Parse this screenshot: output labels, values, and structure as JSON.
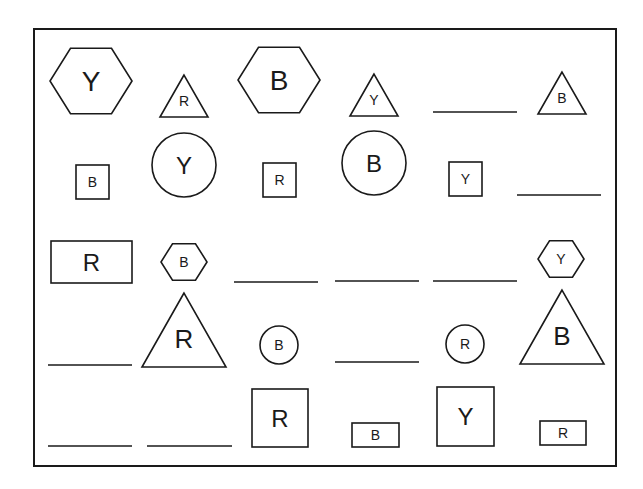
{
  "frame": {
    "x": 34,
    "y": 29,
    "w": 582,
    "h": 437
  },
  "shapes": [
    {
      "id": "r1c1",
      "type": "hexagon",
      "letter": "Y",
      "cx": 91,
      "cy": 81,
      "r": 41,
      "font": 28
    },
    {
      "id": "r1c2",
      "type": "triangle",
      "letter": "R",
      "cx": 184,
      "cy": 96,
      "w": 48,
      "h": 42,
      "font": 14
    },
    {
      "id": "r1c3",
      "type": "hexagon",
      "letter": "B",
      "cx": 279,
      "cy": 80,
      "r": 41,
      "font": 28
    },
    {
      "id": "r1c4",
      "type": "triangle",
      "letter": "Y",
      "cx": 374,
      "cy": 95,
      "w": 48,
      "h": 42,
      "font": 14
    },
    {
      "id": "r1c5",
      "type": "blank",
      "x1": 433,
      "x2": 517,
      "y": 112
    },
    {
      "id": "r1c6",
      "type": "triangle",
      "letter": "B",
      "cx": 562,
      "cy": 93,
      "w": 48,
      "h": 42,
      "font": 14
    },
    {
      "id": "r2c1",
      "type": "square",
      "letter": "B",
      "x": 76,
      "y": 165,
      "w": 33,
      "h": 34,
      "font": 14
    },
    {
      "id": "r2c2",
      "type": "circle",
      "letter": "Y",
      "cx": 184,
      "cy": 165,
      "r": 32,
      "font": 24
    },
    {
      "id": "r2c3",
      "type": "square",
      "letter": "R",
      "x": 263,
      "y": 163,
      "w": 33,
      "h": 34,
      "font": 14
    },
    {
      "id": "r2c4",
      "type": "circle",
      "letter": "B",
      "cx": 374,
      "cy": 163,
      "r": 32,
      "font": 24
    },
    {
      "id": "r2c5",
      "type": "square",
      "letter": "Y",
      "x": 449,
      "y": 162,
      "w": 33,
      "h": 34,
      "font": 14
    },
    {
      "id": "r2c6",
      "type": "blank",
      "x1": 517,
      "x2": 601,
      "y": 195
    },
    {
      "id": "r3c1",
      "type": "rect",
      "letter": "R",
      "x": 51,
      "y": 241,
      "w": 81,
      "h": 42,
      "font": 24
    },
    {
      "id": "r3c2",
      "type": "hexagon",
      "letter": "B",
      "cx": 184,
      "cy": 262,
      "r": 23,
      "font": 14
    },
    {
      "id": "r3c3",
      "type": "blank",
      "x1": 234,
      "x2": 318,
      "y": 282
    },
    {
      "id": "r3c4",
      "type": "blank",
      "x1": 335,
      "x2": 419,
      "y": 281
    },
    {
      "id": "r3c5",
      "type": "blank",
      "x1": 433,
      "x2": 517,
      "y": 281
    },
    {
      "id": "r3c6",
      "type": "hexagon",
      "letter": "Y",
      "cx": 561,
      "cy": 259,
      "r": 23,
      "font": 14
    },
    {
      "id": "r4c1",
      "type": "blank",
      "x1": 48,
      "x2": 132,
      "y": 365
    },
    {
      "id": "r4c2",
      "type": "triangle",
      "letter": "R",
      "cx": 184,
      "cy": 330,
      "w": 84,
      "h": 74,
      "font": 26
    },
    {
      "id": "r4c3",
      "type": "circle",
      "letter": "B",
      "cx": 279,
      "cy": 345,
      "r": 19,
      "font": 14
    },
    {
      "id": "r4c4",
      "type": "blank",
      "x1": 335,
      "x2": 419,
      "y": 362
    },
    {
      "id": "r4c5",
      "type": "circle",
      "letter": "R",
      "cx": 465,
      "cy": 344,
      "r": 19,
      "font": 14
    },
    {
      "id": "r4c6",
      "type": "triangle",
      "letter": "B",
      "cx": 562,
      "cy": 327,
      "w": 84,
      "h": 74,
      "font": 26
    },
    {
      "id": "r5c1",
      "type": "blank",
      "x1": 48,
      "x2": 132,
      "y": 446
    },
    {
      "id": "r5c2",
      "type": "blank",
      "x1": 147,
      "x2": 232,
      "y": 446
    },
    {
      "id": "r5c3",
      "type": "square",
      "letter": "R",
      "x": 252,
      "y": 389,
      "w": 56,
      "h": 58,
      "font": 24
    },
    {
      "id": "r5c4",
      "type": "rect",
      "letter": "B",
      "x": 352,
      "y": 423,
      "w": 47,
      "h": 24,
      "font": 14
    },
    {
      "id": "r5c5",
      "type": "square",
      "letter": "Y",
      "x": 437,
      "y": 387,
      "w": 57,
      "h": 59,
      "font": 24
    },
    {
      "id": "r5c6",
      "type": "rect",
      "letter": "R",
      "x": 540,
      "y": 421,
      "w": 46,
      "h": 24,
      "font": 14
    }
  ]
}
